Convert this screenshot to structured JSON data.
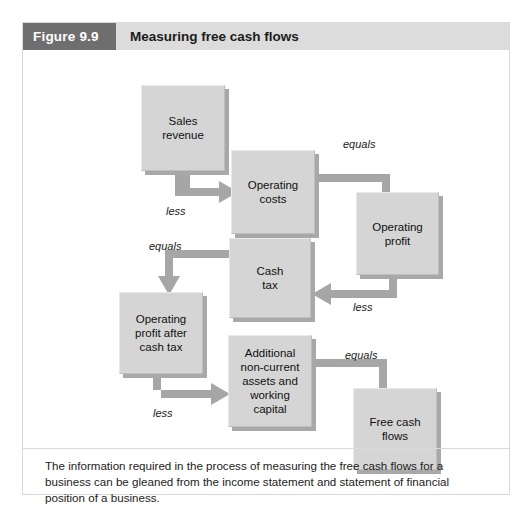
{
  "figure": {
    "number": "Figure 9.9",
    "title": "Measuring free cash flows",
    "caption": "The information required in the process of measuring the free cash flows for a business can be gleaned from the income statement and statement of financial position of a business."
  },
  "diagram": {
    "type": "flowchart",
    "nodes": [
      {
        "id": "sales-revenue",
        "label": "Sales\nrevenue",
        "x": 118,
        "y": 35,
        "w": 84,
        "h": 86
      },
      {
        "id": "operating-costs",
        "label": "Operating\ncosts",
        "x": 208,
        "y": 100,
        "w": 84,
        "h": 84
      },
      {
        "id": "operating-profit",
        "label": "Operating\nprofit",
        "x": 333,
        "y": 142,
        "w": 83,
        "h": 83
      },
      {
        "id": "cash-tax",
        "label": "Cash\ntax",
        "x": 206,
        "y": 188,
        "w": 82,
        "h": 80
      },
      {
        "id": "operating-profit-after-cash-tax",
        "label": "Operating\nprofit after\ncash tax",
        "x": 96,
        "y": 242,
        "w": 84,
        "h": 82
      },
      {
        "id": "additional-assets",
        "label": "Additional\nnon-current\nassets and\nworking\ncapital",
        "x": 205,
        "y": 285,
        "w": 84,
        "h": 92
      },
      {
        "id": "free-cash-flows",
        "label": "Free cash\nflows",
        "x": 330,
        "y": 338,
        "w": 84,
        "h": 82
      }
    ],
    "connectors": [
      {
        "id": "sales-to-operating-costs",
        "label": "less",
        "from": "sales-revenue",
        "to": "operating-costs",
        "label_x": 143,
        "label_y": 155
      },
      {
        "id": "costs-to-operating-profit",
        "label": "equals",
        "from": "operating-costs",
        "to": "operating-profit",
        "label_x": 320,
        "label_y": 88
      },
      {
        "id": "profit-to-cash-tax",
        "label": "less",
        "from": "operating-profit",
        "to": "cash-tax",
        "label_x": 330,
        "label_y": 251
      },
      {
        "id": "cash-tax-to-profit-after",
        "label": "equals",
        "from": "cash-tax",
        "to": "operating-profit-after-cash-tax",
        "label_x": 126,
        "label_y": 190
      },
      {
        "id": "profit-after-to-additional",
        "label": "less",
        "from": "operating-profit-after-cash-tax",
        "to": "additional-assets",
        "label_x": 130,
        "label_y": 357
      },
      {
        "id": "additional-to-free-cash",
        "label": "equals",
        "from": "additional-assets",
        "to": "free-cash-flows",
        "label_x": 322,
        "label_y": 299
      }
    ],
    "arrow_color": "#a6a6a6"
  },
  "colors": {
    "figure_number_bg": "#6e6e6e",
    "header_bg": "#dcdcdc",
    "node_fill": "#d5d5d5",
    "node_shadow": "#a8a8a8",
    "arrow": "#a6a6a6",
    "text": "#111111"
  }
}
